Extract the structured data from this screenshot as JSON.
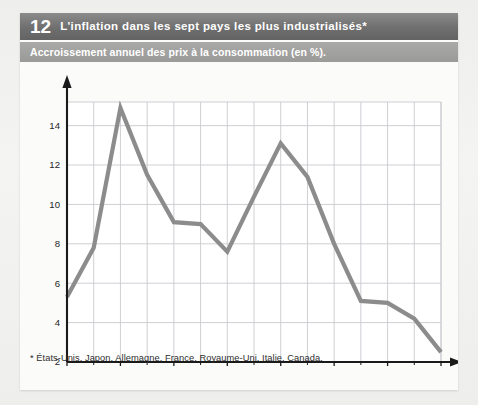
{
  "figure": {
    "number": "12",
    "title": "L'inflation dans les sept pays les plus industrialisés*",
    "subtitle": "Accroissement annuel des prix à la consommation (en %).",
    "footnote": "* États-Unis, Japon, Allemagne, France, Royaume-Uni, Italie, Canada."
  },
  "colors": {
    "header_band": "#6f6f6f",
    "subtitle_band": "#9a9a98",
    "line": "#8c8c8c",
    "grid": "#c9c9cf",
    "axis": "#1a1a1a",
    "card": "#fbfbfa",
    "page": "#eeeeec",
    "text": "#262626",
    "band_text": "#ffffff"
  },
  "chart_data": {
    "type": "line",
    "title": "L'inflation dans les sept pays les plus industrialisés*",
    "subtitle": "Accroissement annuel des prix à la consommation (en %).",
    "xlabel": "",
    "ylabel": "",
    "yunit": "%",
    "xlim": [
      1972,
      1986
    ],
    "ylim": [
      2,
      15.2
    ],
    "grid": true,
    "legend": false,
    "x": [
      1972,
      1973,
      1974,
      1975,
      1976,
      1977,
      1978,
      1979,
      1980,
      1981,
      1982,
      1983,
      1984,
      1985,
      1986
    ],
    "values": [
      5.3,
      7.8,
      14.9,
      11.5,
      9.1,
      9.0,
      7.6,
      10.4,
      13.1,
      11.4,
      8.0,
      5.1,
      5.0,
      4.2,
      2.5
    ],
    "series": [
      {
        "name": "Inflation (G7)",
        "values": [
          5.3,
          7.8,
          14.9,
          11.5,
          9.1,
          9.0,
          7.6,
          10.4,
          13.1,
          11.4,
          8.0,
          5.1,
          5.0,
          4.2,
          2.5
        ]
      }
    ],
    "x_major_ticks": [
      1972,
      1974,
      1976,
      1978,
      1980,
      1982,
      1984,
      1986
    ],
    "x_major_tick_labels": [
      "1972",
      "1974",
      "1976",
      "1978",
      "1980",
      "1982",
      "1984",
      "1986"
    ],
    "x_minor_ticks": [
      1973,
      1975,
      1977,
      1979,
      1981,
      1983,
      1985
    ],
    "y_ticks": [
      2,
      4,
      6,
      8,
      10,
      12,
      14
    ],
    "y_tick_labels": [
      "2",
      "4",
      "6",
      "8",
      "10",
      "12",
      "14"
    ]
  }
}
